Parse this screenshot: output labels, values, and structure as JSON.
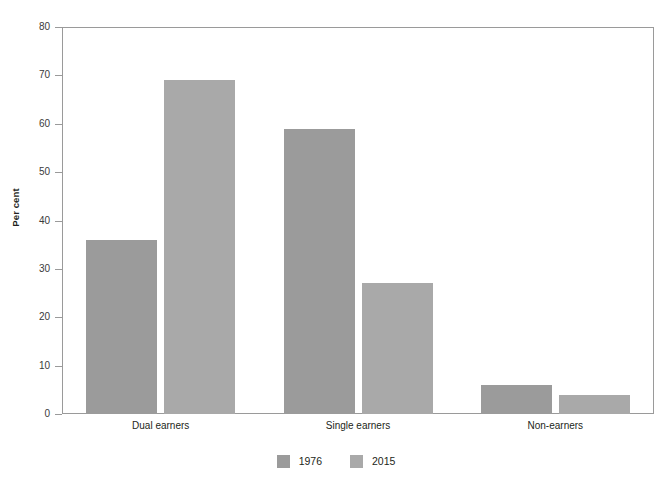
{
  "chart_data": {
    "type": "bar",
    "title": "",
    "subtitle": "",
    "xlabel": "",
    "ylabel": "Per cent",
    "categories": [
      "Dual earners",
      "Single earners",
      "Non-earners"
    ],
    "series": [
      {
        "name": "1976",
        "color": "#9b9b9b",
        "values": [
          36,
          59,
          6
        ]
      },
      {
        "name": "2015",
        "color": "#a9a9a9",
        "values": [
          69,
          27,
          4
        ]
      }
    ],
    "ylim": [
      0,
      80
    ],
    "yticks": [
      0,
      10,
      20,
      30,
      40,
      50,
      60,
      70,
      80
    ],
    "ytick_labels": [
      "0",
      "10",
      "20",
      "30",
      "40",
      "50",
      "60",
      "70",
      "80"
    ],
    "grid": false,
    "legend_position": "bottom-center",
    "annotations": []
  },
  "legend": {
    "items": [
      {
        "label": "1976",
        "swatch": "legend-swatch-1976"
      },
      {
        "label": "2015",
        "swatch": "legend-swatch-2015"
      }
    ]
  }
}
